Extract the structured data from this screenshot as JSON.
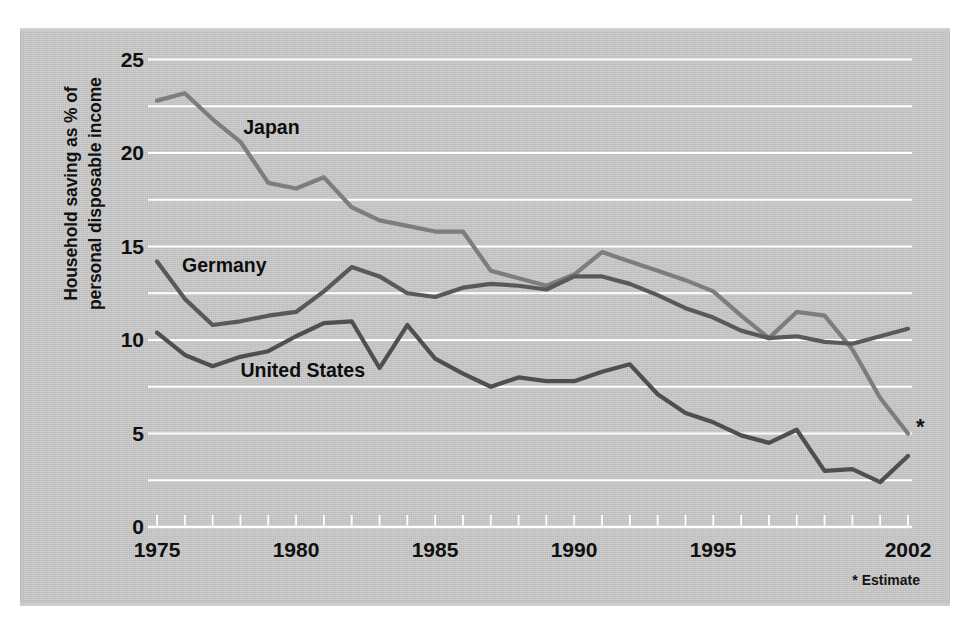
{
  "chart_data": {
    "type": "line",
    "title": "",
    "xlabel": "",
    "ylabel": "Household saving as % of\npersonal disposable income",
    "ylabel_line1": "Household saving as % of",
    "ylabel_line2": "personal disposable income",
    "xlim": [
      1975,
      2002
    ],
    "ylim": [
      0,
      25
    ],
    "ytick_labels": [
      "0",
      "5",
      "10",
      "15",
      "20",
      "25"
    ],
    "ytick_values": [
      0,
      5,
      10,
      15,
      20,
      25
    ],
    "gridline_values": [
      0,
      2.5,
      5,
      7.5,
      10,
      12.5,
      15,
      17.5,
      20,
      22.5,
      25
    ],
    "grid": true,
    "grid_color": "#ffffff",
    "xtick_labels": [
      "1975",
      "1980",
      "1985",
      "1990",
      "1995",
      "2002"
    ],
    "xtick_values": [
      1975,
      1980,
      1985,
      1990,
      1995,
      2002
    ],
    "minor_xticks": [
      1975,
      1976,
      1977,
      1978,
      1979,
      1980,
      1981,
      1982,
      1983,
      1984,
      1985,
      1986,
      1987,
      1988,
      1989,
      1990,
      1991,
      1992,
      1993,
      1994,
      1995,
      1996,
      1997,
      1998,
      1999,
      2000,
      2001,
      2002
    ],
    "legend_position": "inline-labels",
    "footnote": "* Estimate",
    "asterisk": "*",
    "x": [
      1975,
      1976,
      1977,
      1978,
      1979,
      1980,
      1981,
      1982,
      1983,
      1984,
      1985,
      1986,
      1987,
      1988,
      1989,
      1990,
      1991,
      1992,
      1993,
      1994,
      1995,
      1996,
      1997,
      1998,
      1999,
      2000,
      2001,
      2002
    ],
    "series": [
      {
        "name": "Japan",
        "color": "#7d7d7d",
        "label_x": 1978.1,
        "label_y": 21.3,
        "values": [
          22.8,
          23.2,
          21.8,
          20.6,
          18.4,
          18.1,
          18.7,
          17.1,
          16.4,
          16.1,
          15.8,
          15.8,
          13.7,
          13.3,
          12.9,
          13.5,
          14.7,
          14.2,
          13.7,
          13.2,
          12.6,
          11.3,
          10.1,
          11.5,
          11.3,
          9.5,
          6.9,
          5.0
        ]
      },
      {
        "name": "Germany",
        "color": "#595959",
        "label_x": 1975.9,
        "label_y": 13.9,
        "values": [
          14.2,
          12.2,
          10.8,
          11.0,
          11.3,
          11.5,
          12.6,
          13.9,
          13.4,
          12.5,
          12.3,
          12.8,
          13.0,
          12.9,
          12.7,
          13.4,
          13.4,
          13.0,
          12.4,
          11.7,
          11.2,
          10.5,
          10.1,
          10.2,
          9.9,
          9.8,
          10.2,
          10.6
        ]
      },
      {
        "name": "United States",
        "color": "#4f4f4f",
        "label_x": 1978.0,
        "label_y": 8.3,
        "values": [
          10.4,
          9.2,
          8.6,
          9.1,
          9.4,
          10.2,
          10.9,
          11.0,
          8.5,
          10.8,
          9.0,
          8.2,
          7.5,
          8.0,
          7.8,
          7.8,
          8.3,
          8.7,
          7.1,
          6.1,
          5.6,
          4.9,
          4.5,
          5.2,
          3.0,
          3.1,
          2.4,
          3.8
        ]
      }
    ]
  },
  "axes": {
    "x_pixel_start": 157,
    "x_pixel_end": 908,
    "y_pixel_zero": 527,
    "y_pixel_max": 59.5
  }
}
